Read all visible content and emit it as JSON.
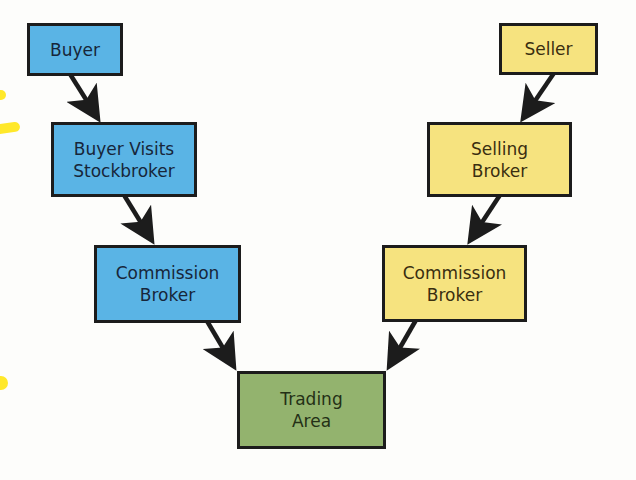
{
  "diagram": {
    "type": "flowchart",
    "colors": {
      "buyer_side": "#5ab4e5",
      "seller_side": "#f6e37f",
      "trading_area": "#93b36e",
      "arrow": "#1c1c1c",
      "border": "#1c1c1c"
    },
    "buyer_side": {
      "nodes": [
        {
          "id": "buyer",
          "lines": [
            "Buyer"
          ]
        },
        {
          "id": "buyer-visits-stockbroker",
          "lines": [
            "Buyer Visits",
            "Stockbroker"
          ]
        },
        {
          "id": "commission-broker-buyer",
          "lines": [
            "Commission",
            "Broker"
          ]
        }
      ]
    },
    "seller_side": {
      "nodes": [
        {
          "id": "seller",
          "lines": [
            "Seller"
          ]
        },
        {
          "id": "selling-broker",
          "lines": [
            "Selling",
            "Broker"
          ]
        },
        {
          "id": "commission-broker-seller",
          "lines": [
            "Commission",
            "Broker"
          ]
        }
      ]
    },
    "center": {
      "id": "trading-area",
      "lines": [
        "Trading",
        "Area"
      ]
    },
    "edges": [
      {
        "from": "buyer",
        "to": "buyer-visits-stockbroker"
      },
      {
        "from": "buyer-visits-stockbroker",
        "to": "commission-broker-buyer"
      },
      {
        "from": "commission-broker-buyer",
        "to": "trading-area"
      },
      {
        "from": "seller",
        "to": "selling-broker"
      },
      {
        "from": "selling-broker",
        "to": "commission-broker-seller"
      },
      {
        "from": "commission-broker-seller",
        "to": "trading-area"
      }
    ]
  }
}
